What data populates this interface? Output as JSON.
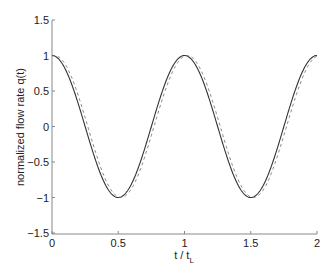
{
  "chart_data": {
    "type": "line",
    "title": "",
    "xlabel": "t / t_L",
    "xlabel_main": "t / t",
    "xlabel_sub": "L",
    "ylabel": "normalized flow rate q(t)",
    "xlim": [
      0,
      2
    ],
    "ylim": [
      -1.5,
      1.5
    ],
    "grid": false,
    "legend": null,
    "x_ticks": [
      0,
      0.5,
      1,
      1.5,
      2
    ],
    "x_tick_labels": [
      "0",
      "0.5",
      "1",
      "1.5",
      "2"
    ],
    "y_ticks": [
      -1.5,
      -1,
      -0.5,
      0,
      0.5,
      1,
      1.5
    ],
    "y_tick_labels": [
      "-1.5",
      "-1",
      "-0.5",
      "0",
      "0.5",
      "1",
      "1.5"
    ],
    "series": [
      {
        "name": "solid",
        "style": "solid",
        "color": "#333333",
        "x": [
          0,
          0.125,
          0.25,
          0.375,
          0.5,
          0.625,
          0.75,
          0.875,
          1.0,
          1.125,
          1.25,
          1.375,
          1.5,
          1.625,
          1.75,
          1.875,
          2.0
        ],
        "values": [
          1,
          0.707,
          0,
          -0.707,
          -1,
          -0.707,
          0,
          0.707,
          1,
          0.707,
          0,
          -0.707,
          -1,
          -0.707,
          0,
          0.707,
          1
        ]
      },
      {
        "name": "dashed",
        "style": "dashed",
        "color": "#777777",
        "x": [
          0,
          0.125,
          0.25,
          0.375,
          0.5,
          0.625,
          0.75,
          0.875,
          1.0,
          1.125,
          1.25,
          1.375,
          1.5,
          1.625,
          1.75,
          1.875,
          2.0
        ],
        "values": [
          0.99,
          0.79,
          0.13,
          -0.61,
          -0.99,
          -0.79,
          -0.13,
          0.61,
          0.99,
          0.79,
          0.13,
          -0.61,
          -0.99,
          -0.79,
          -0.13,
          0.61,
          0.99
        ]
      }
    ],
    "phase_shift_dashed": 0.02
  }
}
